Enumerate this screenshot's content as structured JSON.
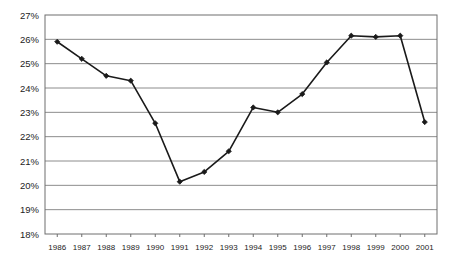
{
  "chart_data": {
    "type": "line",
    "title": "",
    "subtitle": "",
    "xlabel": "",
    "ylabel": "",
    "categories": [
      "1986",
      "1987",
      "1988",
      "1989",
      "1990",
      "1991",
      "1992",
      "1993",
      "1994",
      "1995",
      "1996",
      "1997",
      "1998",
      "1999",
      "2000",
      "2001"
    ],
    "values": [
      25.9,
      25.2,
      24.5,
      24.3,
      22.55,
      20.15,
      20.55,
      21.4,
      23.2,
      23.0,
      23.75,
      25.05,
      26.15,
      26.1,
      26.15,
      22.6
    ],
    "series": [
      {
        "name": "",
        "values": [
          25.9,
          25.2,
          24.5,
          24.3,
          22.55,
          20.15,
          20.55,
          21.4,
          23.2,
          23.0,
          23.75,
          25.05,
          26.15,
          26.1,
          26.15,
          22.6
        ]
      }
    ],
    "ylim": [
      18,
      27
    ],
    "ytick_labels": [
      "27%",
      "26%",
      "25%",
      "24%",
      "23%",
      "22%",
      "21%",
      "20%",
      "19%",
      "18%"
    ],
    "ytick_values": [
      27,
      26,
      25,
      24,
      23,
      22,
      21,
      20,
      19,
      18
    ],
    "xtick_labels": [
      "1986",
      "1987",
      "1988",
      "1989",
      "1990",
      "1991",
      "1992",
      "1993",
      "1994",
      "1995",
      "1996",
      "1997",
      "1998",
      "1999",
      "2000",
      "2001"
    ],
    "grid": "horizontal",
    "legend": "none",
    "marker": "diamond",
    "annotations": []
  },
  "style": {
    "line_color": "#1a1a1a",
    "marker_color": "#1a1a1a",
    "grid_color": "#8c8c8c",
    "axis_color": "#6e6e6e",
    "text_color": "#232323",
    "background": "#ffffff"
  },
  "plot": {
    "left": 45,
    "right": 437,
    "top": 15,
    "bottom": 234
  }
}
